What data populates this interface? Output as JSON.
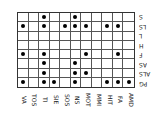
{
  "chart_data": {
    "type": "table",
    "orientation_note": "figure displayed rotated 180 degrees",
    "columns": [
      "VA",
      "TOS",
      "TI",
      "SIE",
      "SOS",
      "NS",
      "MOT",
      "MMI",
      "HIT",
      "FA",
      "AMD"
    ],
    "rows": [
      "S",
      "LS",
      "L",
      "H",
      "F",
      "AS",
      "ALS",
      "PG"
    ],
    "dots": [
      [
        0,
        0,
        1,
        0,
        0,
        1,
        0,
        0,
        0,
        0,
        0
      ],
      [
        1,
        0,
        1,
        0,
        1,
        1,
        1,
        0,
        1,
        1,
        0
      ],
      [
        0,
        0,
        0,
        0,
        0,
        0,
        0,
        0,
        0,
        0,
        0
      ],
      [
        0,
        0,
        0,
        0,
        0,
        0,
        0,
        0,
        0,
        0,
        0
      ],
      [
        1,
        0,
        1,
        0,
        0,
        0,
        1,
        0,
        0,
        1,
        0
      ],
      [
        0,
        0,
        1,
        0,
        0,
        1,
        0,
        0,
        0,
        0,
        0
      ],
      [
        0,
        0,
        1,
        0,
        0,
        1,
        1,
        0,
        0,
        0,
        0
      ],
      [
        1,
        0,
        1,
        1,
        0,
        1,
        0,
        0,
        1,
        1,
        1
      ]
    ]
  }
}
